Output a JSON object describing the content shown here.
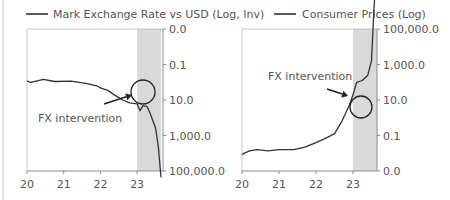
{
  "chart_data": [
    {
      "type": "line",
      "id": "left",
      "legend": "Mark Exchange Rate vs USD (Log, Inv)",
      "legend_placement": "top",
      "xlabel": "",
      "ylabel": "",
      "x_ticks": [
        "20",
        "21",
        "22",
        "23"
      ],
      "x_range": [
        20,
        23.65
      ],
      "y_scale": "log-inverted",
      "y_ticks": [
        "0.0",
        "0.1",
        "10.0",
        "1,000.0",
        "100,000.0"
      ],
      "y_axis_side": "right",
      "shaded_x_range": [
        23,
        23.65
      ],
      "annotation": {
        "text": "FX intervention",
        "x": 23.15,
        "level": 2.1
      },
      "series": [
        {
          "name": "Mark Exchange Rate vs USD",
          "x": [
            20.0,
            20.1,
            20.45,
            20.75,
            21.2,
            21.6,
            21.9,
            22.0,
            22.2,
            22.4,
            22.6,
            22.8,
            23.0,
            23.08,
            23.16,
            23.27,
            23.35,
            23.5,
            23.58,
            23.65
          ],
          "level": [
            0.53,
            0.5,
            0.58,
            0.52,
            0.53,
            0.47,
            0.4,
            0.34,
            0.27,
            0.13,
            0.0,
            -0.08,
            -0.11,
            -0.3,
            -0.16,
            -0.18,
            -0.37,
            -0.78,
            -1.33,
            -2.18
          ]
        }
      ]
    },
    {
      "type": "line",
      "id": "right",
      "legend": "Consumer Prices (Log)",
      "legend_placement": "top",
      "xlabel": "",
      "ylabel": "",
      "x_ticks": [
        "20",
        "21",
        "22",
        "23"
      ],
      "x_range": [
        20,
        23.65
      ],
      "y_scale": "log",
      "y_ticks": [
        "0.0",
        "0.1",
        "10.0",
        "1,000.0",
        "100,000.0"
      ],
      "y_axis_side": "right",
      "shaded_x_range": [
        23,
        23.65
      ],
      "annotation": {
        "text": "FX intervention",
        "x": 23.2,
        "level": 1.8
      },
      "series": [
        {
          "name": "Consumer Prices",
          "x": [
            20.0,
            20.2,
            20.4,
            20.7,
            21.0,
            21.4,
            21.7,
            22.0,
            22.3,
            22.5,
            22.7,
            22.9,
            23.0,
            23.1,
            23.25,
            23.4,
            23.5,
            23.57,
            23.63,
            23.65
          ],
          "level": [
            -1.53,
            -1.43,
            -1.4,
            -1.43,
            -1.4,
            -1.4,
            -1.33,
            -1.2,
            -1.06,
            -0.95,
            -0.6,
            -0.15,
            0.15,
            0.5,
            0.55,
            0.7,
            1.1,
            2.6,
            3.55,
            3.96
          ]
        }
      ]
    }
  ]
}
